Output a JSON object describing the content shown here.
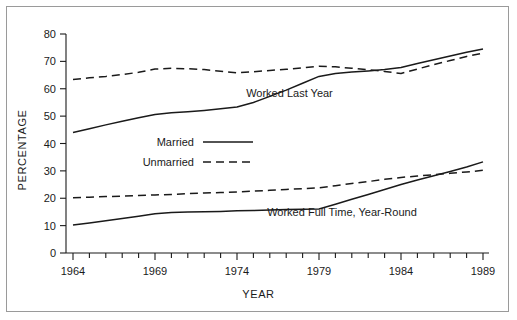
{
  "figure": {
    "background": "#ffffff",
    "border_color": "#9a9a9a",
    "ink_color": "#1a1a1a"
  },
  "chart_data": {
    "type": "line",
    "title": "",
    "xlabel": "YEAR",
    "ylabel": "PERCENTAGE",
    "xlim": [
      1964,
      1989
    ],
    "ylim": [
      0,
      80
    ],
    "yticks": [
      0,
      10,
      20,
      30,
      40,
      50,
      60,
      70,
      80
    ],
    "ytick_labels": [
      "0",
      "10",
      "20",
      "30",
      "40",
      "50",
      "60",
      "70",
      "80"
    ],
    "xticks_labeled": [
      1964,
      1969,
      1974,
      1979,
      1984,
      1989
    ],
    "xtick_labels": [
      "1964",
      "1969",
      "1974",
      "1979",
      "1984",
      "1989"
    ],
    "xtick_minor_every": 1,
    "grid": false,
    "legend_position": "center-left-inside",
    "x": [
      1964,
      1965,
      1966,
      1967,
      1968,
      1969,
      1970,
      1971,
      1972,
      1973,
      1974,
      1975,
      1976,
      1977,
      1978,
      1979,
      1980,
      1981,
      1982,
      1983,
      1984,
      1985,
      1986,
      1987,
      1988,
      1989
    ],
    "series": [
      {
        "name": "Married",
        "group": "Worked Last Year",
        "style": "solid",
        "values": [
          44.0,
          45.4,
          46.8,
          48.1,
          49.4,
          50.6,
          51.2,
          51.6,
          52.1,
          52.7,
          53.3,
          55.0,
          57.2,
          59.5,
          62.0,
          64.5,
          65.6,
          66.1,
          66.5,
          67.0,
          67.8,
          69.2,
          70.6,
          72.0,
          73.3,
          74.5
        ]
      },
      {
        "name": "Unmarried",
        "group": "Worked Last Year",
        "style": "dashed",
        "values": [
          63.4,
          64.0,
          64.5,
          65.2,
          66.0,
          67.2,
          67.5,
          67.3,
          67.0,
          66.4,
          65.8,
          66.2,
          66.7,
          67.1,
          67.6,
          68.2,
          68.0,
          67.5,
          67.0,
          66.3,
          65.6,
          67.2,
          68.8,
          70.3,
          71.8,
          73.0
        ]
      },
      {
        "name": "Married",
        "group": "Worked Full Time, Year-Round",
        "style": "solid",
        "values": [
          10.2,
          11.0,
          11.8,
          12.6,
          13.4,
          14.3,
          14.8,
          15.0,
          15.1,
          15.2,
          15.4,
          15.5,
          15.7,
          15.9,
          16.0,
          16.1,
          17.8,
          19.6,
          21.4,
          23.2,
          25.0,
          26.7,
          28.2,
          29.8,
          31.4,
          33.3
        ]
      },
      {
        "name": "Unmarried",
        "group": "Worked Full Time, Year-Round",
        "style": "dashed",
        "values": [
          20.2,
          20.4,
          20.6,
          20.8,
          21.0,
          21.2,
          21.4,
          21.7,
          21.9,
          22.1,
          22.3,
          22.6,
          22.9,
          23.2,
          23.5,
          23.8,
          24.6,
          25.4,
          26.1,
          26.9,
          27.6,
          28.1,
          28.6,
          29.1,
          29.6,
          30.2
        ]
      }
    ],
    "annotations": [
      {
        "text": "Worked Last Year",
        "x": 1977.2,
        "y": 57.0
      },
      {
        "text": "Worked Full Time, Year-Round",
        "x": 1980.4,
        "y": 13.5
      }
    ],
    "legend": {
      "items": [
        {
          "label": "Married",
          "style": "solid"
        },
        {
          "label": "Unmarried",
          "style": "dashed"
        }
      ]
    }
  }
}
